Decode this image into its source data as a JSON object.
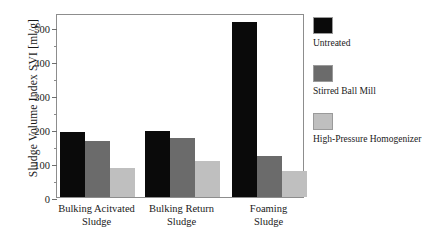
{
  "chart_data": {
    "type": "bar",
    "title": "",
    "xlabel": "",
    "ylabel": "Sludge Volume Index  SVI  [ml/g]",
    "ylim": [
      0,
      540
    ],
    "yticks": [
      0,
      100,
      200,
      300,
      400,
      500
    ],
    "ytick_labels": [
      "0",
      "100",
      "200",
      "300",
      "400",
      "500"
    ],
    "y_minor_ticks": [
      50,
      150,
      250,
      350,
      450
    ],
    "grid": false,
    "legend_position": "right",
    "categories": [
      "Bulking Acitvated Sludge",
      "Bulking Return Sludge",
      "Foaming Sludge"
    ],
    "category_lines": [
      [
        "Bulking Acitvated",
        "Sludge"
      ],
      [
        "Bulking Return",
        "Sludge"
      ],
      [
        "Foaming",
        "Sludge"
      ]
    ],
    "series": [
      {
        "name": "Untreated",
        "color": "#0a0a0a",
        "values": [
          190,
          195,
          513
        ]
      },
      {
        "name": "Stirred Ball Mill",
        "color": "#6b6b6b",
        "values": [
          163,
          173,
          120
        ]
      },
      {
        "name": "High-Pressure Homogenizer",
        "color": "#bfbfbf",
        "values": [
          86,
          105,
          76
        ]
      }
    ]
  },
  "legend": {
    "items": [
      {
        "label": "Untreated",
        "color": "#0a0a0a"
      },
      {
        "label": "Stirred Ball Mill",
        "color": "#6b6b6b"
      },
      {
        "label": "High-Pressure Homogenizer",
        "color": "#bfbfbf"
      }
    ]
  },
  "axis": {
    "y_title": "Sludge Volume Index  SVI  [ml/g]"
  },
  "colors": {
    "untreated": "#0a0a0a",
    "stirred_ball_mill": "#6b6b6b",
    "high_pressure_homogenizer": "#bfbfbf",
    "frame": "#8d8d8d",
    "text": "#1a1a1a",
    "background": "#ffffff"
  }
}
